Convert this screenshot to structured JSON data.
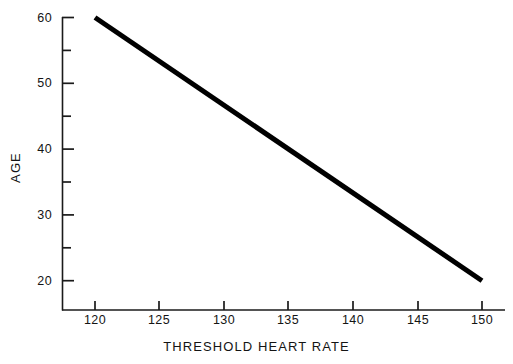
{
  "chart_data": {
    "type": "line",
    "title": "",
    "xlabel": "THRESHOLD HEART RATE",
    "ylabel": "AGE",
    "xlim": [
      118,
      151.5
    ],
    "ylim": [
      17.5,
      60
    ],
    "grid": false,
    "legend": null,
    "x_major_ticks": [
      120,
      125,
      130,
      135,
      140,
      145,
      150
    ],
    "x_tick_labels": [
      "120",
      "125",
      "130",
      "135",
      "140",
      "145",
      "150"
    ],
    "y_major_ticks": [
      20,
      30,
      40,
      50,
      60
    ],
    "y_tick_labels": [
      "20",
      "30",
      "40",
      "50",
      "60"
    ],
    "y_minor_ticks": [
      25,
      35,
      45,
      55
    ],
    "series": [
      {
        "name": "threshold-heart-rate-vs-age",
        "color": "#000000",
        "line_width_px": 5,
        "x": [
          120,
          150
        ],
        "values": [
          60,
          20
        ]
      }
    ],
    "annotations": []
  },
  "axes": {
    "x_axis_name": "x-axis",
    "y_axis_name": "y-axis"
  }
}
